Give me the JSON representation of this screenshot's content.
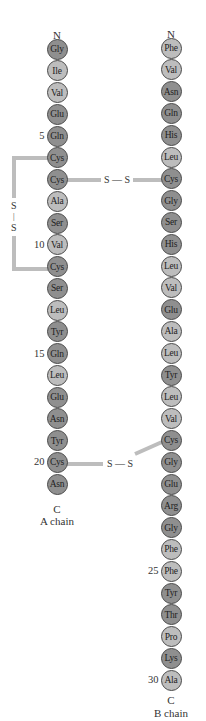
{
  "diagram": {
    "colors": {
      "dark_residue": "#8f8f8f",
      "light_residue": "#bdbdbd",
      "bond": "#bdbdbd",
      "border": "#4a4a4a"
    },
    "a_chain": {
      "n_label": "N",
      "c_label": "C",
      "name": "A chain",
      "residues": [
        {
          "aa": "Gly",
          "shade": "d"
        },
        {
          "aa": "Ile",
          "shade": "l"
        },
        {
          "aa": "Val",
          "shade": "l"
        },
        {
          "aa": "Glu",
          "shade": "d"
        },
        {
          "aa": "Gln",
          "shade": "d"
        },
        {
          "aa": "Cys",
          "shade": "d"
        },
        {
          "aa": "Cys",
          "shade": "d"
        },
        {
          "aa": "Ala",
          "shade": "l"
        },
        {
          "aa": "Ser",
          "shade": "d"
        },
        {
          "aa": "Val",
          "shade": "l"
        },
        {
          "aa": "Cys",
          "shade": "d"
        },
        {
          "aa": "Ser",
          "shade": "d"
        },
        {
          "aa": "Leu",
          "shade": "l"
        },
        {
          "aa": "Tyr",
          "shade": "d"
        },
        {
          "aa": "Gln",
          "shade": "d"
        },
        {
          "aa": "Leu",
          "shade": "l"
        },
        {
          "aa": "Glu",
          "shade": "d"
        },
        {
          "aa": "Asn",
          "shade": "d"
        },
        {
          "aa": "Tyr",
          "shade": "d"
        },
        {
          "aa": "Cys",
          "shade": "d"
        },
        {
          "aa": "Asn",
          "shade": "d"
        }
      ],
      "position_markers": [
        {
          "index": 5,
          "label": "5"
        },
        {
          "index": 10,
          "label": "10"
        },
        {
          "index": 15,
          "label": "15"
        },
        {
          "index": 20,
          "label": "20"
        }
      ]
    },
    "b_chain": {
      "n_label": "N",
      "c_label": "C",
      "name": "B chain",
      "residues": [
        {
          "aa": "Phe",
          "shade": "l"
        },
        {
          "aa": "Val",
          "shade": "l"
        },
        {
          "aa": "Asn",
          "shade": "d"
        },
        {
          "aa": "Gln",
          "shade": "d"
        },
        {
          "aa": "His",
          "shade": "d"
        },
        {
          "aa": "Leu",
          "shade": "l"
        },
        {
          "aa": "Cys",
          "shade": "d"
        },
        {
          "aa": "Gly",
          "shade": "d"
        },
        {
          "aa": "Ser",
          "shade": "d"
        },
        {
          "aa": "His",
          "shade": "d"
        },
        {
          "aa": "Leu",
          "shade": "l"
        },
        {
          "aa": "Val",
          "shade": "l"
        },
        {
          "aa": "Glu",
          "shade": "d"
        },
        {
          "aa": "Ala",
          "shade": "l"
        },
        {
          "aa": "Leu",
          "shade": "l"
        },
        {
          "aa": "Tyr",
          "shade": "d"
        },
        {
          "aa": "Leu",
          "shade": "l"
        },
        {
          "aa": "Val",
          "shade": "l"
        },
        {
          "aa": "Cys",
          "shade": "d"
        },
        {
          "aa": "Gly",
          "shade": "d"
        },
        {
          "aa": "Glu",
          "shade": "d"
        },
        {
          "aa": "Arg",
          "shade": "d"
        },
        {
          "aa": "Gly",
          "shade": "d"
        },
        {
          "aa": "Phe",
          "shade": "l"
        },
        {
          "aa": "Phe",
          "shade": "l"
        },
        {
          "aa": "Tyr",
          "shade": "d"
        },
        {
          "aa": "Thr",
          "shade": "d"
        },
        {
          "aa": "Pro",
          "shade": "l"
        },
        {
          "aa": "Lys",
          "shade": "d"
        },
        {
          "aa": "Ala",
          "shade": "l"
        }
      ],
      "position_markers": [
        {
          "index": 25,
          "label": "25"
        },
        {
          "index": 30,
          "label": "30"
        }
      ]
    },
    "disulfide_bonds": [
      {
        "from": "A6",
        "to": "A11",
        "label_top": "S",
        "label_bottom": "S",
        "dash": "|"
      },
      {
        "from": "A7",
        "to": "B7",
        "label": "S — S"
      },
      {
        "from": "A20",
        "to": "B19",
        "label": "S — S"
      }
    ]
  }
}
